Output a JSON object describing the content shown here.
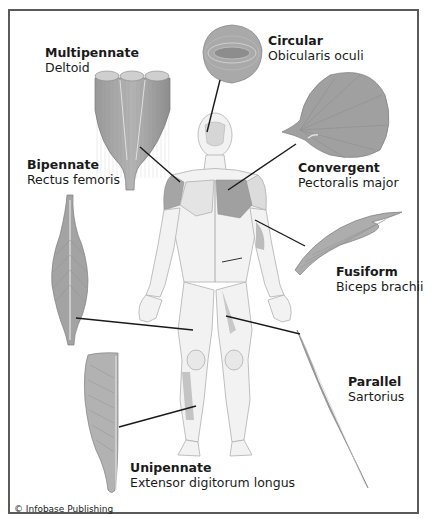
{
  "diagram": {
    "credit": "© Infobase Publishing",
    "colors": {
      "muscle_fill": "#a8a8a8",
      "muscle_dark": "#8a8a8a",
      "muscle_highlight": "#d7d7d7",
      "leader_line": "#1a1a1a",
      "frame": "#5a5a5a",
      "body_outline": "#b5b5b5"
    },
    "labels": [
      {
        "id": "multipennate",
        "type": "Multipennate",
        "muscle": "Deltoid",
        "icon": "multipennate-muscle-icon"
      },
      {
        "id": "circular",
        "type": "Circular",
        "muscle": "Obicularis oculi",
        "icon": "circular-muscle-icon"
      },
      {
        "id": "bipennate",
        "type": "Bipennate",
        "muscle": "Rectus femoris",
        "icon": "bipennate-muscle-icon"
      },
      {
        "id": "convergent",
        "type": "Convergent",
        "muscle": "Pectoralis major",
        "icon": "convergent-muscle-icon"
      },
      {
        "id": "fusiform",
        "type": "Fusiform",
        "muscle": "Biceps brachii",
        "icon": "fusiform-muscle-icon"
      },
      {
        "id": "parallel",
        "type": "Parallel",
        "muscle": "Sartorius",
        "icon": "parallel-muscle-icon"
      },
      {
        "id": "unipennate",
        "type": "Unipennate",
        "muscle": "Extensor digitorum longus",
        "icon": "unipennate-muscle-icon"
      }
    ]
  }
}
